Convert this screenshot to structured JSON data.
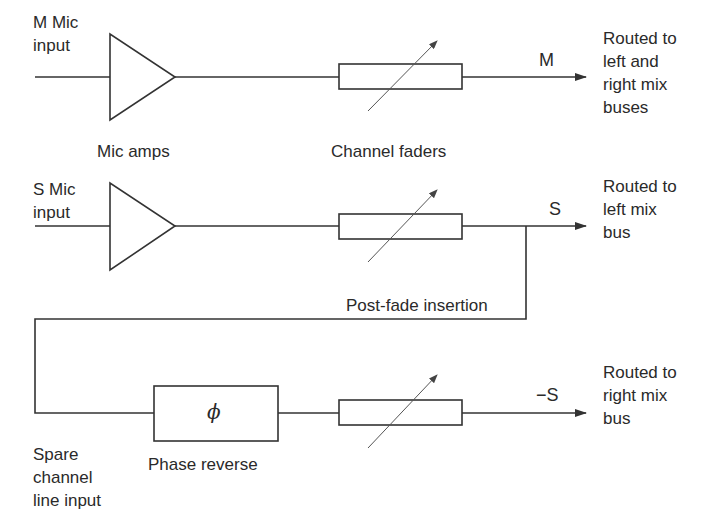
{
  "diagram": {
    "stroke_color": "#333333",
    "background": "#ffffff",
    "channels": [
      {
        "id": "m",
        "input_label": [
          "M Mic",
          "input"
        ],
        "signal_label": "M",
        "output_label": [
          "Routed to",
          "left and",
          "right mix",
          "buses"
        ]
      },
      {
        "id": "s",
        "input_label": [
          "S Mic",
          "input"
        ],
        "signal_label": "S",
        "output_label": [
          "Routed to",
          "left mix",
          "bus"
        ]
      },
      {
        "id": "spare",
        "input_label": [
          "Spare",
          "channel",
          "line input"
        ],
        "signal_label": "−S",
        "output_label": [
          "Routed to",
          "right mix",
          "bus"
        ]
      }
    ],
    "captions": {
      "mic_amps": "Mic amps",
      "channel_faders": "Channel faders",
      "post_fade": "Post-fade insertion",
      "phase_reverse": "Phase reverse"
    },
    "phase_symbol": "ϕ",
    "icons": {
      "amplifier": "triangle",
      "fader": "rectangle-with-diagonal-arrow",
      "phase": "rectangle-with-phi",
      "signal_arrow": "arrowhead-right"
    }
  }
}
